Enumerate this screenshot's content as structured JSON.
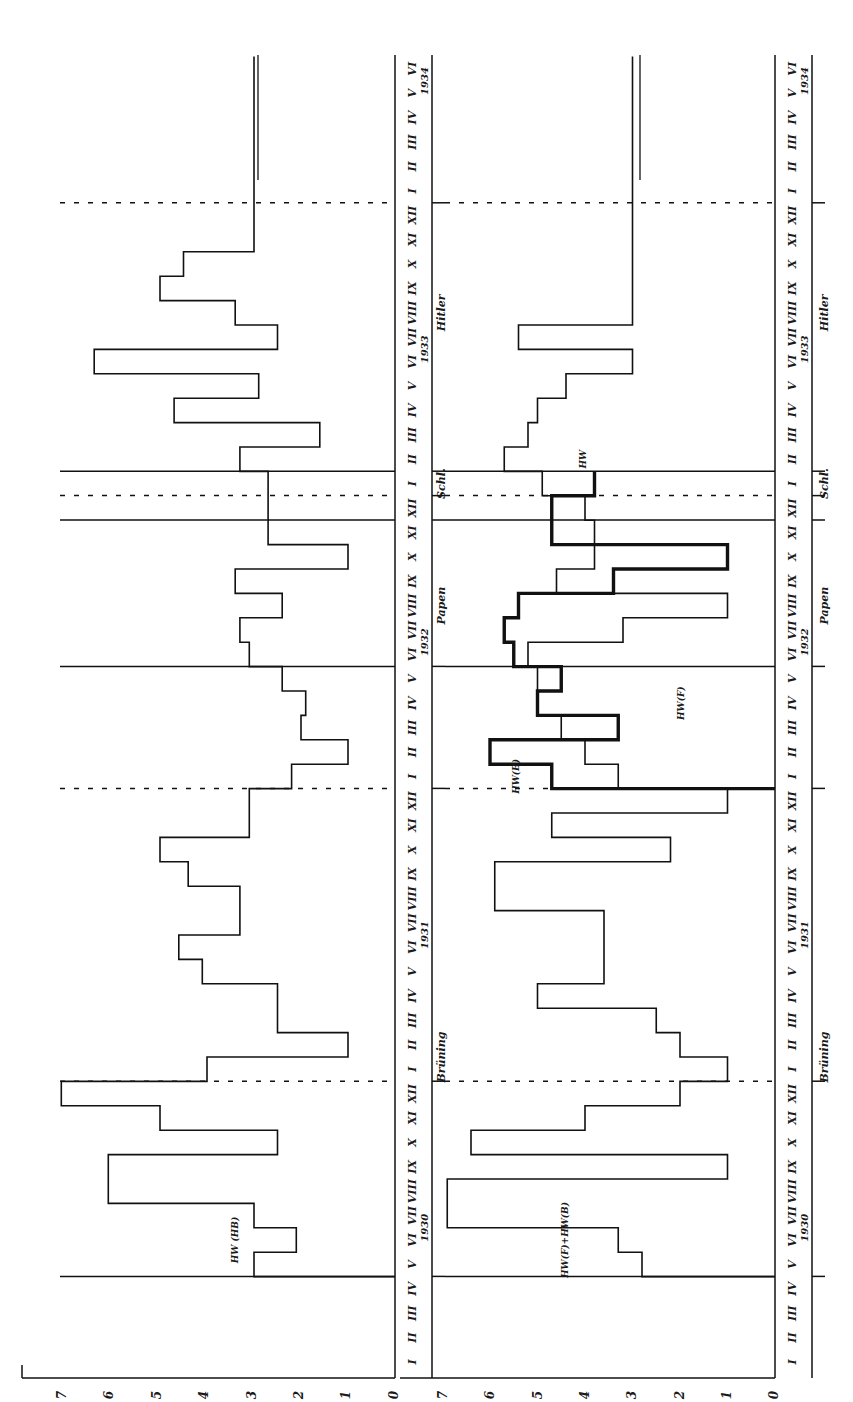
{
  "chart_data": [
    {
      "type": "line",
      "title": "",
      "panel": "left",
      "step": true,
      "xlabel": "Month (1930 I – 1934 VI)",
      "ylabel": "",
      "ylim": [
        0,
        7
      ],
      "yticks": [
        "0",
        "1",
        "2",
        "3",
        "4",
        "5",
        "6",
        "7"
      ],
      "series": [
        {
          "name": "HW (HB)",
          "start": "1930-V",
          "values": [
            3.0,
            2.1,
            3.0,
            6.1,
            6.1,
            2.5,
            5.0,
            7.1,
            4.0,
            1.0,
            2.5,
            2.5,
            4.1,
            4.6,
            3.3,
            3.3,
            4.4,
            5.0,
            3.1,
            3.1,
            2.2,
            1.0,
            2.0,
            1.9,
            2.4,
            3.1,
            3.3,
            2.4,
            3.4,
            1.0,
            2.7,
            2.7,
            2.7,
            3.3,
            1.6,
            4.7,
            2.9,
            6.4,
            2.5,
            3.4,
            5.0,
            4.5,
            3.0,
            3.0,
            3.0,
            3.0,
            3.0,
            3.0,
            3.0,
            3.0
          ],
          "dashed_transitions": [
            "1930-XII→1931-I",
            "1931-X→1931-XII",
            "1932-X→1932-XII",
            "1933-XI→1934-I"
          ]
        }
      ]
    },
    {
      "type": "line",
      "panel": "right",
      "step": true,
      "xlabel": "Month (1930 I – 1934 VI)",
      "ylabel": "",
      "ylim": [
        0,
        7
      ],
      "yticks": [
        "0",
        "1",
        "2",
        "3",
        "4",
        "5",
        "6",
        "7"
      ],
      "series": [
        {
          "name": "HW(F)+HW(B)",
          "start": "1930-V",
          "values": [
            2.8,
            3.3,
            6.9,
            6.9,
            1.0,
            6.4,
            4.0,
            2.0,
            1.0,
            2.0,
            2.5,
            5.0,
            3.6,
            3.6,
            3.6,
            5.9,
            5.9,
            2.2,
            4.7,
            1.0,
            3.3,
            4.0,
            4.5,
            5.0,
            5.0,
            5.2,
            3.2,
            1.0,
            4.6,
            3.8,
            3.8,
            4.0,
            4.9,
            5.7,
            5.2,
            5.0,
            4.4,
            3.0,
            5.4,
            3.0,
            3.0,
            3.0,
            3.0,
            3.0,
            3.0,
            3.0,
            3.0,
            3.0,
            3.0,
            3.0
          ]
        },
        {
          "name": "HW(B) / HW (bold)",
          "start": "1932-I",
          "values": [
            4.7,
            6.0,
            3.3,
            5.0,
            4.5,
            5.5,
            5.7,
            5.4,
            3.4,
            1.0,
            4.7,
            4.7,
            3.8
          ]
        }
      ]
    }
  ],
  "axis": {
    "months": [
      "I",
      "II",
      "III",
      "IV",
      "V",
      "VI",
      "VII",
      "VIII",
      "IX",
      "X",
      "XI",
      "XII"
    ],
    "years": [
      "1930",
      "1931",
      "1932",
      "1933",
      "1934"
    ],
    "yticks_left": [
      "7",
      "6",
      "5",
      "4",
      "3",
      "2",
      "1",
      "0"
    ],
    "yticks_right": [
      "7",
      "6",
      "5",
      "4",
      "3",
      "2",
      "1",
      "0"
    ]
  },
  "eras": {
    "left": [
      "Brüning",
      "Papen",
      "Schl.",
      "Hitler"
    ],
    "right": [
      "Brüning",
      "Papen",
      "Schl.",
      "Hitler"
    ]
  },
  "annotations": {
    "left_series": "HW (HB)",
    "right_series": "HW(F)+HW(B)",
    "hw_b": "HW(B)",
    "hw_f": "HW(F)",
    "hw": "HW"
  }
}
